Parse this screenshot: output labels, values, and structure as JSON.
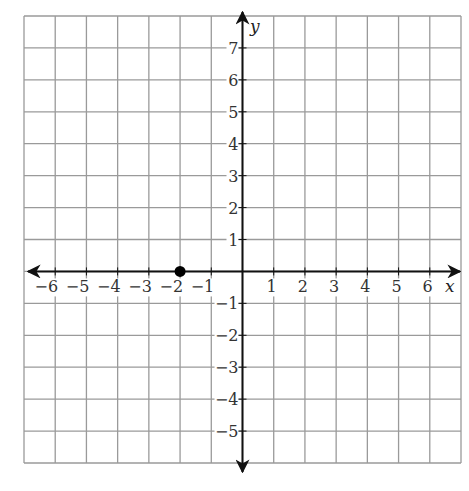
{
  "chart_data": {
    "type": "scatter",
    "title": "",
    "xlabel": "x",
    "ylabel": "y",
    "xlim": [
      -7,
      7
    ],
    "ylim": [
      -6,
      8
    ],
    "grid": true,
    "x_ticks": [
      -6,
      -5,
      -4,
      -3,
      -2,
      -1,
      1,
      2,
      3,
      4,
      5,
      6
    ],
    "y_ticks": [
      -5,
      -4,
      -3,
      -2,
      -1,
      1,
      2,
      3,
      4,
      5,
      6,
      7
    ],
    "x_tick_labels": [
      "−6",
      "−5",
      "−4",
      "−3",
      "−2",
      "−1",
      "1",
      "2",
      "3",
      "4",
      "5",
      "6"
    ],
    "y_tick_labels": [
      "−5",
      "−4",
      "−3",
      "−2",
      "−1",
      "1",
      "2",
      "3",
      "4",
      "5",
      "6",
      "7"
    ],
    "points": [
      {
        "x": -2,
        "y": 0
      }
    ],
    "legend": null
  },
  "axes": {
    "x_label": "x",
    "y_label": "y"
  },
  "colors": {
    "grid": "#9a9a9a",
    "axis": "#111111",
    "point": "#000000"
  }
}
